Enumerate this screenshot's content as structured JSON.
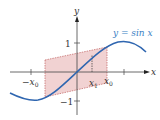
{
  "figure": {
    "curve_label": "y = sin x",
    "axis_x_label": "x",
    "axis_y_label": "y",
    "tick_y_pos": "1",
    "tick_y_neg": "−1",
    "label_neg_x0": "−x",
    "label_neg_x0_sub": "0",
    "label_x1": "x",
    "label_x1_sub": "1",
    "label_x0": "x",
    "label_x0_sub": "0",
    "colors": {
      "curve": "#2f66b0",
      "shade_fill": "#e8b4b4",
      "shade_stroke": "#c06060",
      "axis": "#444444",
      "label_blue": "#3b7fc4"
    }
  }
}
